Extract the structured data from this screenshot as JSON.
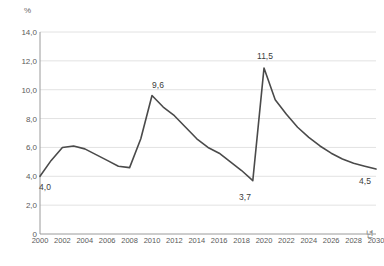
{
  "chart_data": {
    "type": "line",
    "title": "",
    "xlabel": "년",
    "ylabel": "%",
    "xlim": [
      2000,
      2030
    ],
    "ylim": [
      0,
      14
    ],
    "grid": true,
    "legend": false,
    "yticks": [
      "0",
      "2,0",
      "4,0",
      "6,0",
      "8,0",
      "10,0",
      "12,0",
      "14,0"
    ],
    "ytick_values": [
      0,
      2,
      4,
      6,
      8,
      10,
      12,
      14
    ],
    "xticks": [
      "2000",
      "2002",
      "2004",
      "2006",
      "2008",
      "2010",
      "2012",
      "2014",
      "2016",
      "2018",
      "2020",
      "2022",
      "2024",
      "2026",
      "2028",
      "2030"
    ],
    "xtick_values": [
      2000,
      2002,
      2004,
      2006,
      2008,
      2010,
      2012,
      2014,
      2016,
      2018,
      2020,
      2022,
      2024,
      2026,
      2028,
      2030
    ],
    "x": [
      2000,
      2001,
      2002,
      2003,
      2004,
      2005,
      2006,
      2007,
      2008,
      2009,
      2010,
      2011,
      2012,
      2013,
      2014,
      2015,
      2016,
      2017,
      2018,
      2019,
      2020,
      2021,
      2022,
      2023,
      2024,
      2025,
      2026,
      2027,
      2028,
      2029,
      2030
    ],
    "values": [
      4.0,
      5.1,
      6.0,
      6.1,
      5.9,
      5.5,
      5.1,
      4.7,
      4.6,
      6.6,
      9.6,
      8.8,
      8.2,
      7.4,
      6.6,
      6.0,
      5.6,
      5.0,
      4.4,
      3.7,
      11.5,
      9.3,
      8.3,
      7.4,
      6.7,
      6.1,
      5.6,
      5.2,
      4.9,
      4.7,
      4.5
    ],
    "series_color": "#4a4a4a",
    "grid_color": "#e2e2e2",
    "axis_color": "#9a9a9a",
    "point_labels": [
      {
        "x": 2000,
        "y": 4.0,
        "text": "4,0",
        "px": 45,
        "py": 182
      },
      {
        "x": 2010,
        "y": 9.6,
        "text": "9,6",
        "px": 158,
        "py": 80
      },
      {
        "x": 2019,
        "y": 3.7,
        "text": "3,7",
        "px": 245,
        "py": 192
      },
      {
        "x": 2020,
        "y": 11.5,
        "text": "11,5",
        "px": 265,
        "py": 51
      },
      {
        "x": 2030,
        "y": 4.5,
        "text": "4,5",
        "px": 365,
        "py": 176
      }
    ]
  }
}
